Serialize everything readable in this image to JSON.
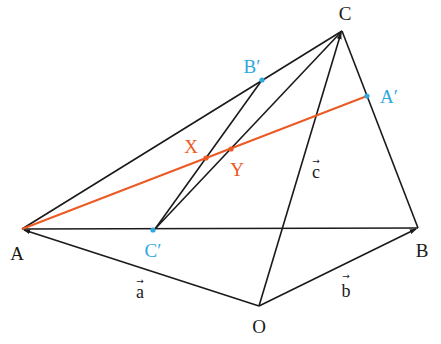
{
  "colors": {
    "line": "#1a1a1a",
    "highlight": "#ec5a24",
    "midpoint": "#2fa8e0",
    "background": "#ffffff"
  },
  "points": {
    "A": {
      "label": "A",
      "x": 22,
      "y": 229,
      "lx": 17,
      "ly": 260
    },
    "B": {
      "label": "B",
      "x": 418,
      "y": 228,
      "lx": 422,
      "ly": 257
    },
    "C": {
      "label": "C",
      "x": 342,
      "y": 31,
      "lx": 345,
      "ly": 20
    },
    "O": {
      "label": "O",
      "x": 259,
      "y": 306,
      "lx": 259,
      "ly": 333
    },
    "Ap": {
      "label": "A′",
      "x": 367,
      "y": 96,
      "lx": 389,
      "ly": 103
    },
    "Bp": {
      "label": "B′",
      "x": 262,
      "y": 80,
      "lx": 252,
      "ly": 73
    },
    "Cp": {
      "label": "C′",
      "x": 153,
      "y": 230,
      "lx": 153,
      "ly": 257
    },
    "X": {
      "label": "X",
      "x": 206,
      "y": 158,
      "lx": 191,
      "ly": 153
    },
    "Y": {
      "label": "Y",
      "x": 231,
      "y": 149,
      "lx": 237,
      "ly": 176
    }
  },
  "vectors": {
    "a": {
      "label": "a",
      "x": 140,
      "y": 298
    },
    "b": {
      "label": "b",
      "x": 346,
      "y": 297
    },
    "c": {
      "label": "c",
      "x": 316,
      "y": 178
    }
  },
  "arrow_glyph": "→"
}
